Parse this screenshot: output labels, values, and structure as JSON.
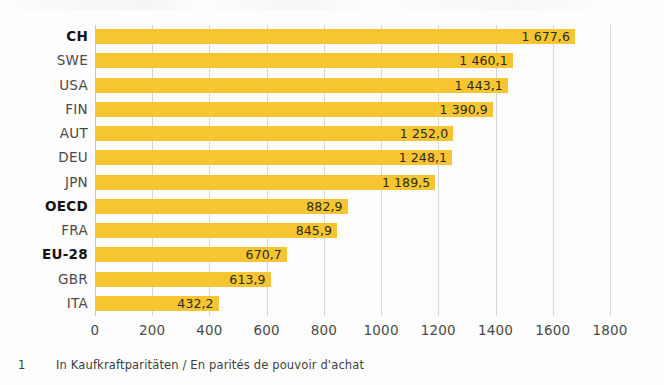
{
  "chart_data": {
    "type": "bar",
    "orientation": "horizontal",
    "title": "",
    "subtitle": "",
    "xlabel": "",
    "ylabel": "",
    "xlim": [
      0,
      1800
    ],
    "xticks": [
      0,
      200,
      400,
      600,
      800,
      1000,
      1200,
      1400,
      1600,
      1800
    ],
    "xtick_labels": [
      "0",
      "200",
      "400",
      "600",
      "800",
      "1000",
      "1200",
      "1400",
      "1600",
      "1800"
    ],
    "grid": true,
    "grid_axis": "x",
    "legend": false,
    "decimal_separator": ",",
    "thousands_separator": " ",
    "bar_color": "#f7c531",
    "grid_color": "#d6d6d6",
    "categories": [
      "CH",
      "SWE",
      "USA",
      "FIN",
      "AUT",
      "DEU",
      "JPN",
      "OECD",
      "FRA",
      "EU-28",
      "GBR",
      "ITA"
    ],
    "values": [
      1677.6,
      1460.1,
      1443.1,
      1390.9,
      1252.0,
      1248.1,
      1189.5,
      882.9,
      845.9,
      670.7,
      613.9,
      432.2
    ],
    "value_labels": [
      "1 677,6",
      "1 460,1",
      "1 443,1",
      "1 390,9",
      "1 252,0",
      "1 248,1",
      "1 189,5",
      "882,9",
      "845,9",
      "670,7",
      "613,9",
      "432,2"
    ],
    "highlighted_categories": [
      "CH",
      "OECD",
      "EU-28"
    ],
    "bars": [
      {
        "category": "CH",
        "value": 1677.6,
        "label": "1 677,6",
        "highlight": true
      },
      {
        "category": "SWE",
        "value": 1460.1,
        "label": "1 460,1",
        "highlight": false
      },
      {
        "category": "USA",
        "value": 1443.1,
        "label": "1 443,1",
        "highlight": false
      },
      {
        "category": "FIN",
        "value": 1390.9,
        "label": "1 390,9",
        "highlight": false
      },
      {
        "category": "AUT",
        "value": 1252.0,
        "label": "1 252,0",
        "highlight": false
      },
      {
        "category": "DEU",
        "value": 1248.1,
        "label": "1 248,1",
        "highlight": false
      },
      {
        "category": "JPN",
        "value": 1189.5,
        "label": "1 189,5",
        "highlight": false
      },
      {
        "category": "OECD",
        "value": 882.9,
        "label": "882,9",
        "highlight": true
      },
      {
        "category": "FRA",
        "value": 845.9,
        "label": "845,9",
        "highlight": false
      },
      {
        "category": "EU-28",
        "value": 670.7,
        "label": "670,7",
        "highlight": true
      },
      {
        "category": "GBR",
        "value": 613.9,
        "label": "613,9",
        "highlight": false
      },
      {
        "category": "ITA",
        "value": 432.2,
        "label": "432,2",
        "highlight": false
      }
    ]
  },
  "footnote": {
    "marker": "1",
    "text": "In Kaufkraftparitäten / En parités de pouvoir d'achat"
  }
}
